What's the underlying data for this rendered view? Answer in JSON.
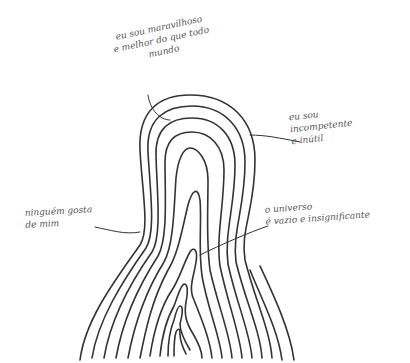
{
  "drawing": {
    "description": "Hand-drawn pencil sketch of nested concentric tongue/finger-shaped contour lines with handwritten Portuguese annotations",
    "stroke_color": "#333333",
    "background": "#ffffff"
  },
  "annotations": {
    "top": {
      "lines": [
        "eu sou maravilhoso",
        "e melhor do que todo",
        "mundo"
      ]
    },
    "right_upper": {
      "lines": [
        "eu sou",
        "incompetente",
        "e inútil"
      ]
    },
    "right_lower": {
      "lines": [
        "o universo",
        "é vazio e insignificante"
      ]
    },
    "left": {
      "lines": [
        "ninguém gosta",
        "de mim"
      ]
    }
  }
}
